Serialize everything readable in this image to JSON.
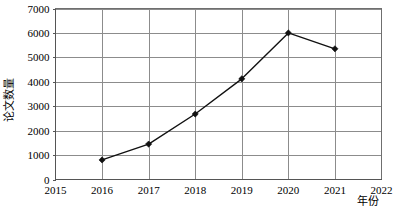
{
  "chart_data": {
    "type": "line",
    "title": "",
    "subtitle": "",
    "xlabel": "年份",
    "ylabel": "论文数量",
    "xlim": [
      2015,
      2022
    ],
    "ylim": [
      0,
      7000
    ],
    "grid": true,
    "legend": "none",
    "x_ticks": [
      "2015",
      "2016",
      "2017",
      "2018",
      "2019",
      "2020",
      "2021",
      "2022"
    ],
    "y_ticks": [
      "0",
      "1000",
      "2000",
      "3000",
      "4000",
      "5000",
      "6000",
      "7000"
    ],
    "x": [
      2016,
      2017,
      2018,
      2019,
      2020,
      2021
    ],
    "values": [
      800,
      1450,
      2680,
      4120,
      6000,
      5350
    ],
    "series": [
      {
        "name": "论文数量",
        "color": "#111111",
        "marker": "diamond",
        "points": [
          {
            "x": 2016,
            "y": 800
          },
          {
            "x": 2017,
            "y": 1450
          },
          {
            "x": 2018,
            "y": 2680
          },
          {
            "x": 2019,
            "y": 4120
          },
          {
            "x": 2020,
            "y": 6000
          },
          {
            "x": 2021,
            "y": 5350
          }
        ]
      }
    ],
    "colors": {
      "line": "#111111",
      "marker": "#111111",
      "grid": "#8c8c8c",
      "border": "#6f6f6f",
      "background": "#ffffff",
      "text": "#000000"
    }
  }
}
